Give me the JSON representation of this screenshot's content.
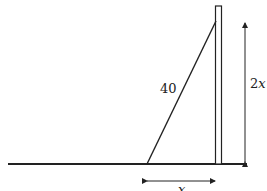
{
  "diagram": {
    "ladder_label": "40",
    "height_label_num": "2",
    "height_label_var": "x",
    "base_label": "x",
    "colors": {
      "stroke": "#222222",
      "background": "#ffffff"
    }
  }
}
